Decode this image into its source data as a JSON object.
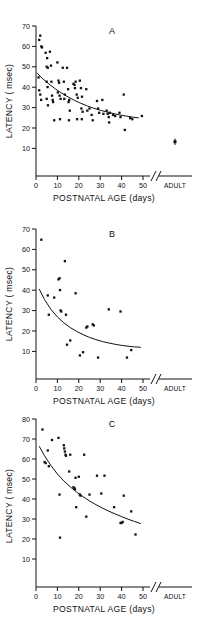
{
  "figure": {
    "panel_count": 3,
    "axis": {
      "x_title": "POSTNATAL AGE  (days)",
      "y_title": "LATENCY ( msec)",
      "x_ticks": [
        "0",
        "10",
        "20",
        "30",
        "40",
        "50"
      ],
      "x_break_symbol": "//",
      "x_adult_label": "ADULT",
      "x_min": 0,
      "x_max": 52
    },
    "colors": {
      "ink": "#111111",
      "background": "#ffffff"
    }
  },
  "panels": [
    {
      "id": "A",
      "label": "A",
      "y_ticks": [
        "70",
        "60",
        "50",
        "40",
        "30",
        "20",
        "10"
      ],
      "y_min": 0,
      "y_max": 72
    },
    {
      "id": "B",
      "label": "B",
      "y_ticks": [
        "70",
        "60",
        "50",
        "40",
        "30",
        "20",
        "10"
      ],
      "y_min": 0,
      "y_max": 72
    },
    {
      "id": "C",
      "label": "C",
      "y_ticks": [
        "80",
        "70",
        "60",
        "50",
        "40",
        "30",
        "20",
        "10"
      ],
      "y_min": 0,
      "y_max": 82
    }
  ],
  "chart_data": [
    {
      "type": "scatter",
      "title": "A",
      "xlabel": "POSTNATAL AGE  (days)",
      "ylabel": "LATENCY ( msec)",
      "xlim": [
        0,
        52
      ],
      "ylim": [
        0,
        72
      ],
      "xticks": [
        0,
        10,
        20,
        30,
        40,
        50
      ],
      "yticks": [
        10,
        20,
        30,
        40,
        50,
        60,
        70
      ],
      "grid": false,
      "legend": "none",
      "series": [
        {
          "name": "latency vs postnatal age",
          "points": [
            [
              1.5,
              63.5
            ],
            [
              2.0,
              65.5
            ],
            [
              2.5,
              60.5
            ],
            [
              2.8,
              60.0
            ],
            [
              1.2,
              46.0
            ],
            [
              1.5,
              40.0
            ],
            [
              2.0,
              38.0
            ],
            [
              2.4,
              35.5
            ],
            [
              4.5,
              57.5
            ],
            [
              5.0,
              51.0
            ],
            [
              5.2,
              55.0
            ],
            [
              5.5,
              50.5
            ],
            [
              5.0,
              44.0
            ],
            [
              5.4,
              41.5
            ],
            [
              5.0,
              36.0
            ],
            [
              5.6,
              33.0
            ],
            [
              6.5,
              58.0
            ],
            [
              7.0,
              51.5
            ],
            [
              7.2,
              44.0
            ],
            [
              7.5,
              37.5
            ],
            [
              7.8,
              35.5
            ],
            [
              8.0,
              34.5
            ],
            [
              8.5,
              26.0
            ],
            [
              10.0,
              53.0
            ],
            [
              10.5,
              44.5
            ],
            [
              10.8,
              43.5
            ],
            [
              10.2,
              39.0
            ],
            [
              11.0,
              37.5
            ],
            [
              11.5,
              36.0
            ],
            [
              11.2,
              26.5
            ],
            [
              12.5,
              50.5
            ],
            [
              13.0,
              44.0
            ],
            [
              13.5,
              38.0
            ],
            [
              13.2,
              36.0
            ],
            [
              14.5,
              50.5
            ],
            [
              15.0,
              40.5
            ],
            [
              15.5,
              35.5
            ],
            [
              15.2,
              34.5
            ],
            [
              15.8,
              30.5
            ],
            [
              15.4,
              26.0
            ],
            [
              17.5,
              43.0
            ],
            [
              18.0,
              42.5
            ],
            [
              18.5,
              44.0
            ],
            [
              18.2,
              41.0
            ],
            [
              19.0,
              38.0
            ],
            [
              19.5,
              36.5
            ],
            [
              19.2,
              26.5
            ],
            [
              20.5,
              44.5
            ],
            [
              21.0,
              41.0
            ],
            [
              21.5,
              37.0
            ],
            [
              21.2,
              31.5
            ],
            [
              21.8,
              30.0
            ],
            [
              21.4,
              26.5
            ],
            [
              23.5,
              40.5
            ],
            [
              24.0,
              30.5
            ],
            [
              25.0,
              31.5
            ],
            [
              26.0,
              28.5
            ],
            [
              26.5,
              26.0
            ],
            [
              28.5,
              35.0
            ],
            [
              29.0,
              31.5
            ],
            [
              29.5,
              29.5
            ],
            [
              31.0,
              35.5
            ],
            [
              31.5,
              29.0
            ],
            [
              33.0,
              30.5
            ],
            [
              33.5,
              29.0
            ],
            [
              34.0,
              27.5
            ],
            [
              34.5,
              29.5
            ],
            [
              34.2,
              25.0
            ],
            [
              36.0,
              28.5
            ],
            [
              37.0,
              28.0
            ],
            [
              39.0,
              29.5
            ],
            [
              39.5,
              27.5
            ],
            [
              41.0,
              38.0
            ],
            [
              41.5,
              21.5
            ],
            [
              44.0,
              27.0
            ],
            [
              45.0,
              26.5
            ],
            [
              49.5,
              28.0
            ]
          ]
        }
      ],
      "fit_curve": {
        "label": "fitted decay",
        "points": [
          [
            0.5,
            48.0
          ],
          [
            3,
            45.5
          ],
          [
            6,
            43.0
          ],
          [
            9,
            40.7
          ],
          [
            12,
            38.7
          ],
          [
            15,
            36.9
          ],
          [
            18,
            35.3
          ],
          [
            21,
            33.9
          ],
          [
            24,
            32.7
          ],
          [
            27,
            31.6
          ],
          [
            30,
            30.7
          ],
          [
            33,
            29.9
          ],
          [
            36,
            29.2
          ],
          [
            39,
            28.5
          ],
          [
            42,
            28.0
          ],
          [
            45,
            27.5
          ],
          [
            48,
            27.1
          ]
        ]
      },
      "adult_point": {
        "label": "ADULT",
        "value": 16.0,
        "error_low": 14.5,
        "error_high": 17.5
      }
    },
    {
      "type": "scatter",
      "title": "B",
      "xlabel": "POSTNATAL AGE  (days)",
      "ylabel": "LATENCY ( msec)",
      "xlim": [
        0,
        52
      ],
      "ylim": [
        0,
        72
      ],
      "xticks": [
        0,
        10,
        20,
        30,
        40,
        50
      ],
      "yticks": [
        10,
        20,
        30,
        40,
        50,
        60,
        70
      ],
      "grid": false,
      "legend": "none",
      "series": [
        {
          "name": "latency vs postnatal age",
          "points": [
            [
              2.5,
              65.0
            ],
            [
              5.5,
              39.0
            ],
            [
              6.0,
              30.0
            ],
            [
              8.5,
              38.0
            ],
            [
              10.5,
              46.5
            ],
            [
              11.0,
              47.0
            ],
            [
              11.2,
              41.5
            ],
            [
              11.5,
              32.0
            ],
            [
              11.8,
              31.5
            ],
            [
              13.5,
              55.0
            ],
            [
              14.0,
              30.0
            ],
            [
              14.5,
              16.0
            ],
            [
              16.0,
              18.0
            ],
            [
              18.5,
              40.0
            ],
            [
              20.5,
              11.0
            ],
            [
              22.0,
              12.5
            ],
            [
              23.5,
              24.0
            ],
            [
              24.0,
              24.5
            ],
            [
              26.5,
              25.5
            ],
            [
              27.0,
              25.0
            ],
            [
              29.0,
              10.0
            ],
            [
              34.0,
              32.5
            ],
            [
              39.5,
              31.5
            ],
            [
              42.5,
              10.0
            ],
            [
              44.5,
              13.5
            ]
          ]
        }
      ],
      "fit_curve": {
        "label": "fitted decay",
        "points": [
          [
            1.5,
            42.0
          ],
          [
            4,
            37.0
          ],
          [
            7,
            32.5
          ],
          [
            10,
            29.0
          ],
          [
            13,
            26.2
          ],
          [
            16,
            24.0
          ],
          [
            19,
            22.2
          ],
          [
            22,
            20.7
          ],
          [
            25,
            19.4
          ],
          [
            28,
            18.4
          ],
          [
            31,
            17.5
          ],
          [
            34,
            16.8
          ],
          [
            37,
            16.2
          ],
          [
            40,
            15.7
          ],
          [
            43,
            15.3
          ],
          [
            46,
            15.0
          ],
          [
            49,
            14.8
          ]
        ]
      },
      "adult_point": null
    },
    {
      "type": "scatter",
      "title": "C",
      "xlabel": "POSTNATAL AGE  (days)",
      "ylabel": "LATENCY ( msec)",
      "xlim": [
        0,
        52
      ],
      "ylim": [
        0,
        82
      ],
      "xticks": [
        0,
        10,
        20,
        30,
        40,
        50
      ],
      "yticks": [
        10,
        20,
        30,
        40,
        50,
        60,
        70,
        80
      ],
      "grid": false,
      "legend": "none",
      "series": [
        {
          "name": "latency vs postnatal age",
          "points": [
            [
              3.0,
              75.0
            ],
            [
              4.0,
              59.5
            ],
            [
              4.5,
              59.0
            ],
            [
              5.5,
              65.0
            ],
            [
              6.0,
              57.5
            ],
            [
              7.5,
              70.0
            ],
            [
              10.5,
              71.0
            ],
            [
              11.0,
              44.0
            ],
            [
              11.2,
              23.5
            ],
            [
              13.0,
              67.5
            ],
            [
              13.2,
              66.0
            ],
            [
              13.5,
              64.5
            ],
            [
              13.8,
              63.0
            ],
            [
              14.0,
              62.5
            ],
            [
              15.5,
              55.0
            ],
            [
              16.0,
              63.0
            ],
            [
              17.5,
              47.5
            ],
            [
              18.0,
              47.0
            ],
            [
              18.2,
              46.5
            ],
            [
              18.5,
              52.0
            ],
            [
              18.8,
              38.0
            ],
            [
              20.0,
              52.5
            ],
            [
              20.5,
              44.0
            ],
            [
              20.8,
              43.5
            ],
            [
              22.5,
              63.0
            ],
            [
              23.5,
              33.5
            ],
            [
              25.0,
              44.0
            ],
            [
              28.5,
              53.0
            ],
            [
              30.5,
              44.5
            ],
            [
              32.0,
              53.0
            ],
            [
              36.5,
              38.0
            ],
            [
              39.5,
              30.5
            ],
            [
              40.0,
              30.5
            ],
            [
              40.5,
              31.0
            ],
            [
              41.0,
              43.5
            ],
            [
              44.5,
              36.0
            ],
            [
              46.5,
              25.0
            ]
          ]
        }
      ],
      "fit_curve": {
        "label": "fitted decay",
        "points": [
          [
            1.5,
            67.0
          ],
          [
            4,
            62.5
          ],
          [
            7,
            57.8
          ],
          [
            10,
            53.8
          ],
          [
            13,
            50.5
          ],
          [
            16,
            47.7
          ],
          [
            19,
            45.2
          ],
          [
            22,
            43.0
          ],
          [
            25,
            41.0
          ],
          [
            28,
            39.2
          ],
          [
            31,
            37.6
          ],
          [
            34,
            36.1
          ],
          [
            37,
            34.8
          ],
          [
            40,
            33.5
          ],
          [
            43,
            32.3
          ],
          [
            46,
            31.2
          ],
          [
            49,
            30.2
          ]
        ]
      },
      "adult_point": null
    }
  ]
}
